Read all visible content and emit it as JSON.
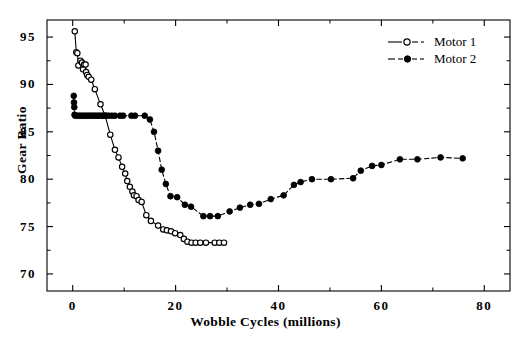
{
  "chart_data": {
    "type": "line",
    "title": "",
    "subtitle": "",
    "xlabel": "Wobble  Cycles  (millions)",
    "ylabel": "Gear Ratio",
    "xlim": [
      -5,
      85
    ],
    "ylim": [
      68.2,
      96.8
    ],
    "xticks": [
      0,
      20,
      40,
      60,
      80
    ],
    "xtick_labels": [
      "0",
      "20",
      "40",
      "60",
      "80"
    ],
    "xminor_ticks": [
      10,
      30,
      50,
      70
    ],
    "yticks": [
      70,
      75,
      80,
      85,
      90,
      95
    ],
    "ytick_labels": [
      "70",
      "75",
      "80",
      "85",
      "90",
      "95"
    ],
    "yminor_ticks": [
      72.5,
      77.5,
      82.5,
      87.5,
      92.5
    ],
    "grid": false,
    "legend_position": "top-right",
    "series": [
      {
        "name": "Motor 1",
        "marker": "open-circle",
        "linestyle": "solid-thin",
        "color": "#000000",
        "points": [
          [
            0.4,
            95.6
          ],
          [
            0.7,
            93.4
          ],
          [
            0.9,
            93.3
          ],
          [
            1.1,
            92.0
          ],
          [
            1.5,
            92.5
          ],
          [
            1.8,
            92.3
          ],
          [
            2.0,
            91.6
          ],
          [
            2.2,
            92.1
          ],
          [
            2.5,
            92.1
          ],
          [
            2.6,
            91.3
          ],
          [
            2.8,
            91.0
          ],
          [
            3.1,
            90.8
          ],
          [
            3.6,
            90.5
          ],
          [
            4.3,
            89.5
          ],
          [
            5.4,
            87.9
          ],
          [
            6.3,
            86.7
          ],
          [
            7.3,
            84.7
          ],
          [
            8.2,
            83.1
          ],
          [
            8.9,
            82.3
          ],
          [
            9.6,
            81.3
          ],
          [
            10.2,
            80.6
          ],
          [
            10.6,
            79.8
          ],
          [
            11.1,
            79.2
          ],
          [
            11.6,
            78.7
          ],
          [
            11.9,
            78.3
          ],
          [
            12.4,
            78.2
          ],
          [
            12.8,
            77.8
          ],
          [
            13.4,
            77.6
          ],
          [
            14.3,
            76.2
          ],
          [
            15.2,
            75.6
          ],
          [
            16.6,
            75.1
          ],
          [
            17.6,
            74.7
          ],
          [
            18.3,
            74.6
          ],
          [
            19.1,
            74.5
          ],
          [
            19.9,
            74.3
          ],
          [
            20.9,
            74.1
          ],
          [
            21.6,
            73.7
          ],
          [
            22.3,
            73.4
          ],
          [
            23.1,
            73.3
          ],
          [
            23.9,
            73.3
          ],
          [
            24.8,
            73.3
          ],
          [
            25.9,
            73.3
          ],
          [
            27.6,
            73.3
          ],
          [
            28.5,
            73.3
          ],
          [
            29.4,
            73.3
          ]
        ]
      },
      {
        "name": "Motor 2",
        "marker": "filled-circle",
        "linestyle": "dashed",
        "color": "#000000",
        "points": [
          [
            0.2,
            88.8
          ],
          [
            0.25,
            88.1
          ],
          [
            0.3,
            87.6
          ],
          [
            0.35,
            86.8
          ],
          [
            0.5,
            86.7
          ],
          [
            0.9,
            86.7
          ],
          [
            1.3,
            86.7
          ],
          [
            1.7,
            86.7
          ],
          [
            2.1,
            86.7
          ],
          [
            2.5,
            86.7
          ],
          [
            2.9,
            86.7
          ],
          [
            3.3,
            86.7
          ],
          [
            3.7,
            86.7
          ],
          [
            4.1,
            86.7
          ],
          [
            4.5,
            86.7
          ],
          [
            4.9,
            86.7
          ],
          [
            5.3,
            86.7
          ],
          [
            5.7,
            86.7
          ],
          [
            6.1,
            86.7
          ],
          [
            6.5,
            86.7
          ],
          [
            7.0,
            86.7
          ],
          [
            7.6,
            86.7
          ],
          [
            8.2,
            86.7
          ],
          [
            9.2,
            86.7
          ],
          [
            9.8,
            86.7
          ],
          [
            11.4,
            86.7
          ],
          [
            12.1,
            86.7
          ],
          [
            14.0,
            86.7
          ],
          [
            15.0,
            86.3
          ],
          [
            15.8,
            85.0
          ],
          [
            16.6,
            83.0
          ],
          [
            17.3,
            81.0
          ],
          [
            18.1,
            79.5
          ],
          [
            19.0,
            78.2
          ],
          [
            20.3,
            78.1
          ],
          [
            21.8,
            77.3
          ],
          [
            23.0,
            77.1
          ],
          [
            25.4,
            76.1
          ],
          [
            26.7,
            76.1
          ],
          [
            28.2,
            76.1
          ],
          [
            30.5,
            76.6
          ],
          [
            32.5,
            77.0
          ],
          [
            34.5,
            77.3
          ],
          [
            36.2,
            77.4
          ],
          [
            38.5,
            77.9
          ],
          [
            41.0,
            78.3
          ],
          [
            43.0,
            79.4
          ],
          [
            44.3,
            79.7
          ],
          [
            46.5,
            80.0
          ],
          [
            50.2,
            80.0
          ],
          [
            54.5,
            80.1
          ],
          [
            56.0,
            80.9
          ],
          [
            58.2,
            81.4
          ],
          [
            60.0,
            81.5
          ],
          [
            63.6,
            82.1
          ],
          [
            67.0,
            82.1
          ],
          [
            71.5,
            82.3
          ],
          [
            75.8,
            82.2
          ]
        ]
      }
    ]
  },
  "legend": {
    "items": [
      {
        "label": "Motor 1"
      },
      {
        "label": "Motor 2"
      }
    ]
  }
}
